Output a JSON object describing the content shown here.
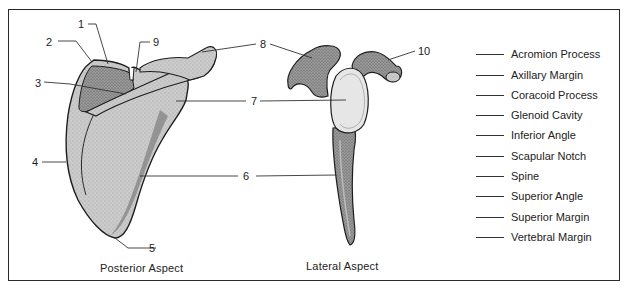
{
  "diagram": {
    "subject": "Scapula",
    "views": [
      {
        "id": "posterior",
        "caption": "Posterior Aspect"
      },
      {
        "id": "lateral",
        "caption": "Lateral Aspect"
      }
    ],
    "callouts": [
      {
        "number": "1",
        "x": 78,
        "y": 19
      },
      {
        "number": "2",
        "x": 46,
        "y": 37
      },
      {
        "number": "3",
        "x": 35,
        "y": 79
      },
      {
        "number": "4",
        "x": 32,
        "y": 157
      },
      {
        "number": "5",
        "x": 148,
        "y": 243
      },
      {
        "number": "6",
        "x": 243,
        "y": 172
      },
      {
        "number": "7",
        "x": 252,
        "y": 96
      },
      {
        "number": "8",
        "x": 261,
        "y": 40
      },
      {
        "number": "9",
        "x": 153,
        "y": 38
      },
      {
        "number": "10",
        "x": 419,
        "y": 46
      }
    ],
    "answer_key": {
      "blank_line": "______",
      "terms": [
        "Acromion Process",
        "Axillary Margin",
        "Coracoid Process",
        "Glenoid Cavity",
        "Inferior Angle",
        "Scapular Notch",
        "Spine",
        "Superior Angle",
        "Superior Margin",
        "Vertebral Margin"
      ]
    },
    "colors": {
      "bone_fill": "#c9c9c9",
      "bone_shade": "#8e8e8e",
      "bone_dark": "#6a6a6a",
      "glenoid_fill": "#e6e6e6",
      "outline": "#1e1e1e",
      "frame": "#2a2a2a"
    }
  }
}
